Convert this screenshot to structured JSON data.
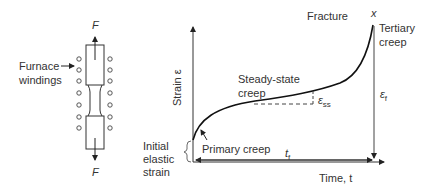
{
  "specimen": {
    "force_top": "F",
    "force_bottom": "F",
    "furnace_label_line1": "Furnace",
    "furnace_label_line2": "windings"
  },
  "plot": {
    "y_axis_label": "Strain ε",
    "x_axis_label": "Time, t",
    "fracture_label": "Fracture",
    "fracture_marker": "x",
    "tertiary_line1": "Tertiary",
    "tertiary_line2": "creep",
    "steady_line1": "Steady-state",
    "steady_line2": "creep",
    "ess_label": "ε",
    "ess_sub": "ss",
    "ef_label": "ε",
    "ef_sub": "f",
    "primary_label": "Primary creep",
    "initial_line1": "Initial",
    "initial_line2": "elastic",
    "initial_line3": "strain",
    "tf_label": "t",
    "tf_sub": "f"
  }
}
